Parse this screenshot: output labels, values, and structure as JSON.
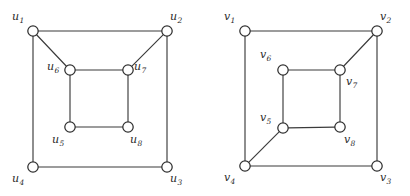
{
  "figure": {
    "background_color": "#ffffff",
    "edge_color": "#3b3b3b",
    "node_fill": "#ffffff",
    "node_stroke": "#2f2f2f",
    "label_color": "#2b2b2b",
    "node_radius": 5.2,
    "clipped_header_text": "",
    "graphs": [
      {
        "id": "left-graph",
        "name": "graph-u",
        "vertex_prefix": "u",
        "vertices": [
          {
            "id": "u1",
            "base": "u",
            "sub": "1",
            "cx": 33,
            "cy": 31,
            "label_x": 12,
            "label_y": 11,
            "label_anchor": "above-left"
          },
          {
            "id": "u2",
            "base": "u",
            "sub": "2",
            "cx": 167,
            "cy": 31,
            "label_x": 170,
            "label_y": 11,
            "label_anchor": "above-right"
          },
          {
            "id": "u3",
            "base": "u",
            "sub": "3",
            "cx": 167,
            "cy": 167,
            "label_x": 170,
            "label_y": 173,
            "label_anchor": "below-right"
          },
          {
            "id": "u4",
            "base": "u",
            "sub": "4",
            "cx": 33,
            "cy": 167,
            "label_x": 12,
            "label_y": 173,
            "label_anchor": "below-left"
          },
          {
            "id": "u5",
            "base": "u",
            "sub": "5",
            "cx": 70,
            "cy": 127,
            "label_x": 52,
            "label_y": 134,
            "label_anchor": "below-left"
          },
          {
            "id": "u6",
            "base": "u",
            "sub": "6",
            "cx": 70,
            "cy": 70,
            "label_x": 47,
            "label_y": 61,
            "label_anchor": "left"
          },
          {
            "id": "u7",
            "base": "u",
            "sub": "7",
            "cx": 128,
            "cy": 70,
            "label_x": 134,
            "label_y": 61,
            "label_anchor": "right"
          },
          {
            "id": "u8",
            "base": "u",
            "sub": "8",
            "cx": 128,
            "cy": 127,
            "label_x": 130,
            "label_y": 134,
            "label_anchor": "below-right"
          }
        ],
        "edges": [
          {
            "from": "u1",
            "to": "u2",
            "kind": "outer-top"
          },
          {
            "from": "u2",
            "to": "u3",
            "kind": "outer-right"
          },
          {
            "from": "u3",
            "to": "u4",
            "kind": "outer-bottom"
          },
          {
            "from": "u4",
            "to": "u1",
            "kind": "outer-left"
          },
          {
            "from": "u6",
            "to": "u7",
            "kind": "inner-top"
          },
          {
            "from": "u7",
            "to": "u8",
            "kind": "inner-right"
          },
          {
            "from": "u8",
            "to": "u5",
            "kind": "inner-bottom"
          },
          {
            "from": "u5",
            "to": "u6",
            "kind": "inner-left"
          },
          {
            "from": "u1",
            "to": "u6",
            "kind": "spoke-diagonal"
          },
          {
            "from": "u2",
            "to": "u7",
            "kind": "spoke-diagonal"
          }
        ]
      },
      {
        "id": "right-graph",
        "name": "graph-v",
        "vertex_prefix": "v",
        "vertices": [
          {
            "id": "v1",
            "base": "v",
            "sub": "1",
            "cx": 245,
            "cy": 31,
            "label_x": 224,
            "label_y": 11,
            "label_anchor": "above-left"
          },
          {
            "id": "v2",
            "base": "v",
            "sub": "2",
            "cx": 377,
            "cy": 31,
            "label_x": 380,
            "label_y": 11,
            "label_anchor": "above-right"
          },
          {
            "id": "v3",
            "base": "v",
            "sub": "3",
            "cx": 377,
            "cy": 166,
            "label_x": 380,
            "label_y": 172,
            "label_anchor": "below-right"
          },
          {
            "id": "v4",
            "base": "v",
            "sub": "4",
            "cx": 245,
            "cy": 166,
            "label_x": 224,
            "label_y": 172,
            "label_anchor": "below-left"
          },
          {
            "id": "v5",
            "base": "v",
            "sub": "5",
            "cx": 283,
            "cy": 128,
            "label_x": 260,
            "label_y": 112,
            "label_anchor": "above-left"
          },
          {
            "id": "v6",
            "base": "v",
            "sub": "6",
            "cx": 283,
            "cy": 70,
            "label_x": 260,
            "label_y": 49,
            "label_anchor": "above-left"
          },
          {
            "id": "v7",
            "base": "v",
            "sub": "7",
            "cx": 340,
            "cy": 70,
            "label_x": 346,
            "label_y": 76,
            "label_anchor": "below-right"
          },
          {
            "id": "v8",
            "base": "v",
            "sub": "8",
            "cx": 340,
            "cy": 127,
            "label_x": 344,
            "label_y": 134,
            "label_anchor": "below-right"
          }
        ],
        "edges": [
          {
            "from": "v1",
            "to": "v2",
            "kind": "outer-top"
          },
          {
            "from": "v2",
            "to": "v3",
            "kind": "outer-right"
          },
          {
            "from": "v3",
            "to": "v4",
            "kind": "outer-bottom"
          },
          {
            "from": "v4",
            "to": "v1",
            "kind": "outer-left"
          },
          {
            "from": "v6",
            "to": "v7",
            "kind": "inner-top"
          },
          {
            "from": "v7",
            "to": "v8",
            "kind": "inner-right"
          },
          {
            "from": "v8",
            "to": "v5",
            "kind": "inner-bottom"
          },
          {
            "from": "v5",
            "to": "v6",
            "kind": "inner-left"
          },
          {
            "from": "v2",
            "to": "v7",
            "kind": "spoke-diagonal"
          },
          {
            "from": "v4",
            "to": "v5",
            "kind": "spoke-diagonal"
          }
        ]
      }
    ]
  }
}
